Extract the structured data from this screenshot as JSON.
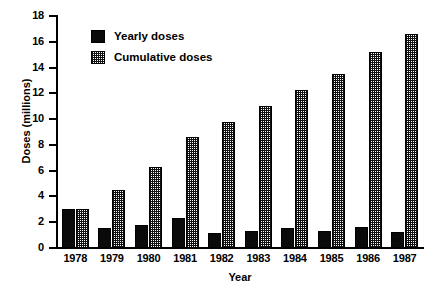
{
  "chart_data": {
    "type": "bar",
    "title": "",
    "xlabel": "Year",
    "ylabel": "Doses (millions)",
    "categories": [
      "1978",
      "1979",
      "1980",
      "1981",
      "1982",
      "1983",
      "1984",
      "1985",
      "1986",
      "1987"
    ],
    "series": [
      {
        "name": "Yearly doses",
        "pattern": "solid-black",
        "values": [
          3.0,
          1.55,
          1.75,
          2.3,
          1.15,
          1.3,
          1.55,
          1.3,
          1.6,
          1.25
        ]
      },
      {
        "name": "Cumulative doses",
        "pattern": "stippled",
        "values": [
          3.0,
          4.5,
          6.3,
          8.6,
          9.8,
          11.05,
          12.25,
          13.5,
          15.2,
          16.6
        ]
      }
    ],
    "ylim": [
      0,
      18
    ],
    "ytick_labels": [
      "0",
      "2",
      "4",
      "6",
      "8",
      "10",
      "12",
      "14",
      "16",
      "18"
    ],
    "ytick_values": [
      0,
      2,
      4,
      6,
      8,
      10,
      12,
      14,
      16,
      18
    ],
    "grid": false,
    "legend_position": "upper-left-inside",
    "colors": {
      "yearly": "#0a0a0a",
      "cumulative": "#6e6e6e",
      "axis": "#000000",
      "background": "#ffffff"
    }
  }
}
